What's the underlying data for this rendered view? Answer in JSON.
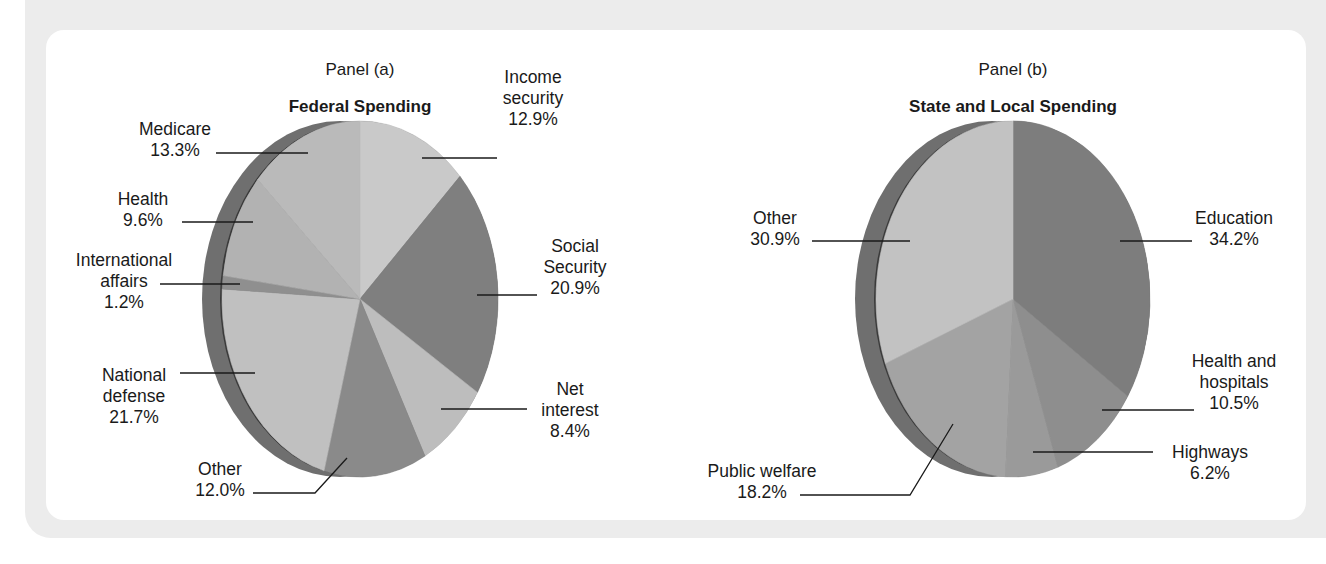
{
  "chart_data": [
    {
      "type": "pie",
      "panel_label": "Panel (a)",
      "title": "Federal Spending",
      "unit": "%",
      "start_angle_deg": 0,
      "direction": "clockwise",
      "slices": [
        {
          "label": "Income security",
          "value": 12.9,
          "display": "12.9%",
          "color": "#c9c9c9"
        },
        {
          "label": "Social Security",
          "value": 20.9,
          "display": "20.9%",
          "color": "#7f7f7f"
        },
        {
          "label": "Net interest",
          "value": 8.4,
          "display": "8.4%",
          "color": "#bdbdbd"
        },
        {
          "label": "Other",
          "value": 12.0,
          "display": "12.0%",
          "color": "#8a8a8a"
        },
        {
          "label": "National defense",
          "value": 21.7,
          "display": "21.7%",
          "color": "#c0c0c0"
        },
        {
          "label": "International affairs",
          "value": 1.2,
          "display": "1.2%",
          "color": "#8f8f8f"
        },
        {
          "label": "Health",
          "value": 9.6,
          "display": "9.6%",
          "color": "#b2b2b2"
        },
        {
          "label": "Medicare",
          "value": 13.3,
          "display": "13.3%",
          "color": "#bababa"
        }
      ],
      "geometry": {
        "cx": 360,
        "cy": 299,
        "rx": 138,
        "ry": 178,
        "rim_offset": 20,
        "rim_color": "#6f6f6f"
      }
    },
    {
      "type": "pie",
      "panel_label": "Panel (b)",
      "title": "State and Local Spending",
      "unit": "%",
      "start_angle_deg": 0,
      "direction": "clockwise",
      "slices": [
        {
          "label": "Education",
          "value": 34.2,
          "display": "34.2%",
          "color": "#7d7d7d"
        },
        {
          "label": "Health and hospitals",
          "value": 10.5,
          "display": "10.5%",
          "color": "#8e8e8e"
        },
        {
          "label": "Highways",
          "value": 6.2,
          "display": "6.2%",
          "color": "#9a9a9a"
        },
        {
          "label": "Public welfare",
          "value": 18.2,
          "display": "18.2%",
          "color": "#a3a3a3"
        },
        {
          "label": "Other",
          "value": 30.9,
          "display": "30.9%",
          "color": "#c2c2c2"
        }
      ],
      "geometry": {
        "cx": 1013,
        "cy": 299,
        "rx": 137,
        "ry": 178,
        "rim_offset": 21,
        "rim_color": "#6f6f6f"
      }
    }
  ],
  "panels": [
    {
      "panel_label": "Panel (a)",
      "title": "Federal Spending",
      "labels": [
        {
          "lines": [
            "Income",
            "security",
            "12.9%"
          ],
          "x": 533,
          "y": 83,
          "anchor": "middle",
          "leader": [
            [
              422,
              158
            ],
            [
              497,
              158
            ]
          ]
        },
        {
          "lines": [
            "Social",
            "Security",
            "20.9%"
          ],
          "x": 575,
          "y": 252,
          "anchor": "middle",
          "leader": [
            [
              477,
              295
            ],
            [
              537,
              295
            ]
          ]
        },
        {
          "lines": [
            "Net",
            "interest",
            "8.4%"
          ],
          "x": 570,
          "y": 395,
          "anchor": "middle",
          "leader": [
            [
              441,
              409
            ],
            [
              527,
              409
            ]
          ]
        },
        {
          "lines": [
            "Other",
            "12.0%"
          ],
          "x": 220,
          "y": 475,
          "anchor": "middle",
          "leader": [
            [
              347,
              458
            ],
            [
              315,
              493
            ],
            [
              253,
              493
            ]
          ]
        },
        {
          "lines": [
            "National",
            "defense",
            "21.7%"
          ],
          "x": 134,
          "y": 381,
          "anchor": "middle",
          "leader": [
            [
              180,
              373
            ],
            [
              255,
              373
            ]
          ]
        },
        {
          "lines": [
            "International",
            "affairs",
            "1.2%"
          ],
          "x": 124,
          "y": 266,
          "anchor": "middle",
          "leader": [
            [
              160,
              284
            ],
            [
              240,
              284
            ]
          ]
        },
        {
          "lines": [
            "Health",
            "9.6%"
          ],
          "x": 143,
          "y": 205,
          "anchor": "middle",
          "leader": [
            [
              182,
              222
            ],
            [
              253,
              222
            ]
          ]
        },
        {
          "lines": [
            "Medicare",
            "13.3%"
          ],
          "x": 175,
          "y": 135,
          "anchor": "middle",
          "leader": [
            [
              216,
              153
            ],
            [
              308,
              153
            ]
          ]
        }
      ]
    },
    {
      "panel_label": "Panel (b)",
      "title": "State and Local Spending",
      "labels": [
        {
          "lines": [
            "Education",
            "34.2%"
          ],
          "x": 1234,
          "y": 224,
          "anchor": "middle",
          "leader": [
            [
              1120,
              241
            ],
            [
              1192,
              241
            ]
          ]
        },
        {
          "lines": [
            "Health and",
            "hospitals",
            "10.5%"
          ],
          "x": 1234,
          "y": 367,
          "anchor": "middle",
          "leader": [
            [
              1102,
              410
            ],
            [
              1194,
              410
            ]
          ]
        },
        {
          "lines": [
            "Highways",
            "6.2%"
          ],
          "x": 1210,
          "y": 458,
          "anchor": "middle",
          "leader": [
            [
              1033,
              452
            ],
            [
              1153,
              452
            ]
          ]
        },
        {
          "lines": [
            "Public welfare",
            "18.2%"
          ],
          "x": 762,
          "y": 477,
          "anchor": "middle",
          "leader": [
            [
              953,
              424
            ],
            [
              910,
              495
            ],
            [
              800,
              495
            ]
          ]
        },
        {
          "lines": [
            "Other",
            "30.9%"
          ],
          "x": 775,
          "y": 224,
          "anchor": "middle",
          "leader": [
            [
              812,
              241
            ],
            [
              910,
              241
            ]
          ]
        }
      ]
    }
  ],
  "headers": {
    "a": {
      "panel_label": "Panel (a)",
      "title": "Federal Spending"
    },
    "b": {
      "panel_label": "Panel (b)",
      "title": "State and Local Spending"
    }
  }
}
